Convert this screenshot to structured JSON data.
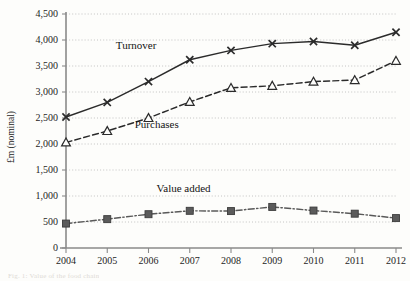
{
  "figure": {
    "caption_fragment": "Fig. 1: Value of the food chain"
  },
  "chart_data": {
    "type": "line",
    "title": "",
    "xlabel": "",
    "ylabel": "£m (nominal)",
    "categories": [
      "2004",
      "2005",
      "2006",
      "2007",
      "2008",
      "2009",
      "2010",
      "2011",
      "2012"
    ],
    "x": [
      2004,
      2005,
      2006,
      2007,
      2008,
      2009,
      2010,
      2011,
      2012
    ],
    "ylim": [
      0,
      4500
    ],
    "yticks": [
      0,
      500,
      1000,
      1500,
      2000,
      2500,
      3000,
      3500,
      4000,
      4500
    ],
    "ytick_labels": [
      "0",
      "500",
      "1,000",
      "1,500",
      "2,000",
      "2,500",
      "3,000",
      "3,500",
      "4,000",
      "4,500"
    ],
    "grid": true,
    "grid_style": "dotted",
    "legend": "inline-annotations",
    "series": [
      {
        "name": "Turnover",
        "marker": "x-cross",
        "line_style": "solid",
        "color": "#2b2b2b",
        "label_x": 2005.7,
        "label_y": 3820,
        "values": [
          2520,
          2800,
          3200,
          3620,
          3800,
          3930,
          3970,
          3900,
          4150
        ]
      },
      {
        "name": "Purchases",
        "marker": "open-triangle",
        "line_style": "dashed",
        "color": "#2b2b2b",
        "label_x": 2006.2,
        "label_y": 2300,
        "values": [
          2030,
          2250,
          2500,
          2810,
          3080,
          3120,
          3200,
          3230,
          3600
        ]
      },
      {
        "name": "Value added",
        "marker": "filled-square",
        "line_style": "dash-dot",
        "color": "#595959",
        "label_x": 2006.85,
        "label_y": 1080,
        "values": [
          470,
          555,
          650,
          715,
          710,
          790,
          720,
          660,
          575
        ]
      }
    ]
  }
}
